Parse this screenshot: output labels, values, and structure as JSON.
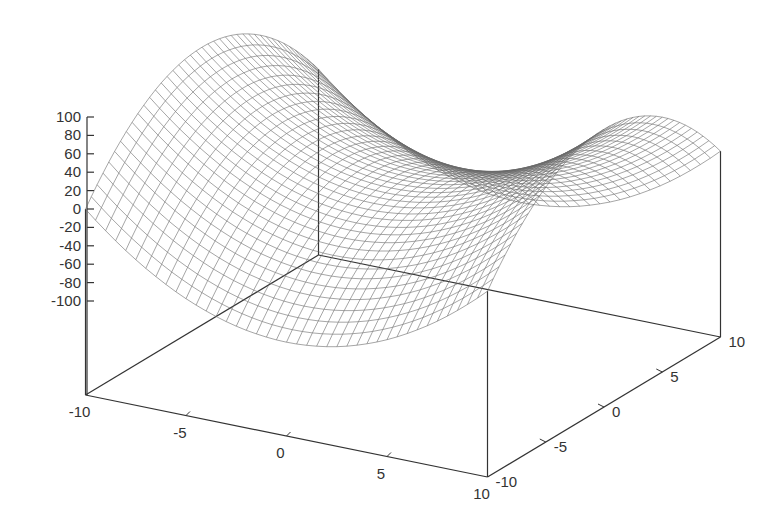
{
  "chart_data": {
    "type": "surface",
    "title": "",
    "function": "z = x^2 - y^2",
    "xlabel": "",
    "ylabel": "",
    "zlabel": "",
    "x_range": [
      -10,
      10
    ],
    "y_range": [
      -10,
      10
    ],
    "z_range": [
      -100,
      100
    ],
    "grid_samples": 40,
    "x_ticks": [
      "-10",
      "-5",
      "0",
      "5",
      "10"
    ],
    "y_ticks": [
      "-10",
      "-5",
      "0",
      "5",
      "10"
    ],
    "z_ticks": [
      "100",
      "80",
      "60",
      "40",
      "20",
      "0",
      "-20",
      "-40",
      "-60",
      "-80",
      "-100"
    ],
    "legend": [],
    "style": "wireframe mesh (hidden3d)",
    "colors": {
      "mesh": "#6a6a6a",
      "axis": "#333333",
      "background": "#ffffff"
    },
    "sample_points": [
      {
        "x": -10,
        "y": -10,
        "z": 0
      },
      {
        "x": -10,
        "y": 0,
        "z": 100
      },
      {
        "x": 0,
        "y": 0,
        "z": 0
      },
      {
        "x": 0,
        "y": 10,
        "z": -100
      },
      {
        "x": 10,
        "y": 0,
        "z": 100
      },
      {
        "x": 10,
        "y": 10,
        "z": 0
      }
    ]
  }
}
